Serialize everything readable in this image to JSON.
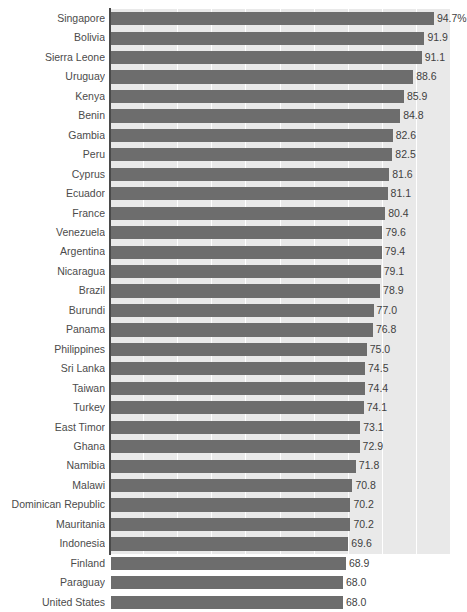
{
  "chart": {
    "title": "",
    "type": "bar"
  },
  "chart_data": {
    "type": "bar",
    "orientation": "horizontal",
    "title": "",
    "subtitle": "",
    "xlabel": "",
    "ylabel": "",
    "xlim": [
      0,
      100
    ],
    "grid": true,
    "gridlines_x": [
      10,
      20,
      30,
      40,
      50,
      60,
      70,
      80,
      90,
      100
    ],
    "legend": false,
    "value_suffix_first": "%",
    "categories": [
      "Singapore",
      "Bolivia",
      "Sierra Leone",
      "Uruguay",
      "Kenya",
      "Benin",
      "Gambia",
      "Peru",
      "Cyprus",
      "Ecuador",
      "France",
      "Venezuela",
      "Argentina",
      "Nicaragua",
      "Brazil",
      "Burundi",
      "Panama",
      "Philippines",
      "Sri Lanka",
      "Taiwan",
      "Turkey",
      "East Timor",
      "Ghana",
      "Namibia",
      "Malawi",
      "Dominican Republic",
      "Mauritania",
      "Indonesia",
      "Finland",
      "Paraguay",
      "United States"
    ],
    "values": [
      94.7,
      91.9,
      91.1,
      88.6,
      85.9,
      84.8,
      82.6,
      82.5,
      81.6,
      81.1,
      80.4,
      79.6,
      79.4,
      79.1,
      78.9,
      77.0,
      76.8,
      75.0,
      74.5,
      74.4,
      74.1,
      73.1,
      72.9,
      71.8,
      70.8,
      70.2,
      70.2,
      69.6,
      68.9,
      68.0,
      68.0
    ],
    "value_labels": [
      "94.7%",
      "91.9",
      "91.1",
      "88.6",
      "85.9",
      "84.8",
      "82.6",
      "82.5",
      "81.6",
      "81.1",
      "80.4",
      "79.6",
      "79.4",
      "79.1",
      "78.9",
      "77.0",
      "76.8",
      "75.0",
      "74.5",
      "74.4",
      "74.1",
      "73.1",
      "72.9",
      "71.8",
      "70.8",
      "70.2",
      "70.2",
      "69.6",
      "68.9",
      "68.0",
      "68.0"
    ],
    "colors": {
      "bar": "#6d6d6d",
      "plot_background": "#e9e9e9",
      "gridline": "#ffffff",
      "axis": "#4a4a4a",
      "label_text": "#4b4b4b",
      "value_text": "#3f3f3f"
    }
  }
}
